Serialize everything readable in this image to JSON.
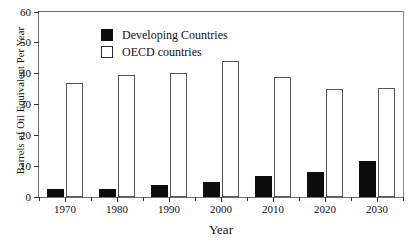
{
  "chart_data": {
    "type": "bar",
    "title": "",
    "xlabel": "Year",
    "ylabel": "Barrels of Oil Equivalent Per Year",
    "categories": [
      "1970",
      "1980",
      "1990",
      "2000",
      "2010",
      "2020",
      "2030"
    ],
    "series": [
      {
        "name": "Developing Countries",
        "color": "#0d0d0d",
        "values": [
          2.5,
          2.7,
          3.9,
          4.8,
          6.8,
          8.0,
          11.8
        ]
      },
      {
        "name": "OECD countries",
        "color": "#ffffff",
        "values": [
          37,
          39.5,
          40.3,
          44,
          39,
          35,
          35.3
        ]
      }
    ],
    "ylim": [
      0,
      60
    ],
    "yticks": [
      0,
      10,
      20,
      30,
      40,
      50,
      60
    ],
    "ytick_labels": [
      "0",
      "10",
      "20",
      "30",
      "40",
      "50",
      "60"
    ],
    "xtick_labels": [
      "1970",
      "1980",
      "1990",
      "2000",
      "2010",
      "2020",
      "2030"
    ],
    "grid": false,
    "legend_position": "top-left"
  },
  "legend": {
    "items": [
      {
        "label": "Developing Countries",
        "swatch": "filled-black-square"
      },
      {
        "label": "OECD countries",
        "swatch": "open-white-square"
      }
    ]
  },
  "axes": {
    "y_title": "Barrels of Oil Equivalent Per Year",
    "x_title": "Year"
  }
}
